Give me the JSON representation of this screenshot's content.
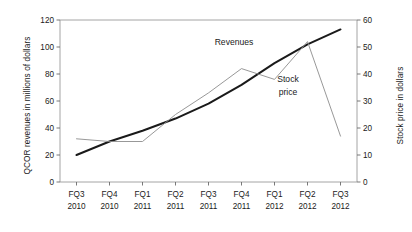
{
  "chart_data": {
    "type": "line",
    "title": "",
    "subtitle": "",
    "xlabel": "",
    "ylabel": "QCOR revenues in millions of dollars",
    "y2label": "Stock price in dollars",
    "categories": [
      "FQ3\n2010",
      "FQ4\n2010",
      "FQ1\n2011",
      "FQ2\n2011",
      "FQ3\n2011",
      "FQ4\n2011",
      "FQ1\n2012",
      "FQ2\n2012",
      "FQ3\n2012"
    ],
    "categories_top": [
      "FQ3",
      "FQ4",
      "FQ1",
      "FQ2",
      "FQ3",
      "FQ4",
      "FQ1",
      "FQ2",
      "FQ3"
    ],
    "categories_bottom": [
      "2010",
      "2010",
      "2011",
      "2011",
      "2011",
      "2011",
      "2012",
      "2012",
      "2012"
    ],
    "ylim": [
      0,
      120
    ],
    "y2lim": [
      0,
      60
    ],
    "yticks": [
      0,
      20,
      40,
      60,
      80,
      100,
      120
    ],
    "y2ticks": [
      0,
      10,
      20,
      30,
      40,
      50,
      60
    ],
    "grid": false,
    "legend_position": "inline-annotations",
    "series": [
      {
        "name": "Revenues",
        "axis": "left",
        "color": "#1a1a1a",
        "line_width": 2.0,
        "values": [
          20,
          30,
          38,
          47,
          58,
          72,
          88,
          102,
          113
        ]
      },
      {
        "name": "Stock price",
        "axis": "right",
        "color": "#8c8c8c",
        "line_width": 0.9,
        "values": [
          16,
          15,
          15,
          25,
          33,
          42,
          38,
          52,
          17
        ]
      }
    ],
    "annotations": [
      {
        "text": "Revenues",
        "x_px": 234,
        "y_px": 45
      },
      {
        "text": "Stock",
        "x_px": 288,
        "y_px": 82
      },
      {
        "text": "price",
        "x_px": 288,
        "y_px": 95
      }
    ]
  },
  "axes": {
    "left_title": "QCOR revenues in millions of dollars",
    "right_title": "Stock price in dollars"
  }
}
